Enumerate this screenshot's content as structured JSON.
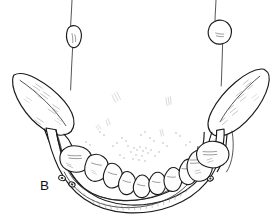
{
  "figure": {
    "panel_label": "B",
    "style": "black-ink-line-art-on-white",
    "background_color": "#ffffff",
    "ink_color": "#1a1a1a",
    "shading_color": "#8d8d8d",
    "canvas": {
      "width": 280,
      "height": 224
    }
  },
  "structures": {
    "mandible_body_label": "mandibular body",
    "left_ramus_label": "left ramus",
    "right_ramus_label": "right ramus",
    "dental_arch_label": "mandibular dental arch",
    "mental_foramen_label": "mental foramen",
    "upper_left_tooth_label": "upper left tooth with root",
    "upper_right_tooth_label": "upper right tooth with root"
  },
  "teeth": {
    "count": 10,
    "arch_labels": [
      "left second molar",
      "left first molar",
      "left second premolar",
      "left first premolar",
      "left canine",
      "right canine",
      "right first premolar",
      "right second premolar",
      "right first molar",
      "right second molar"
    ]
  },
  "annotations": {
    "hatch_groups": 9,
    "stipple_clusters": 6
  }
}
